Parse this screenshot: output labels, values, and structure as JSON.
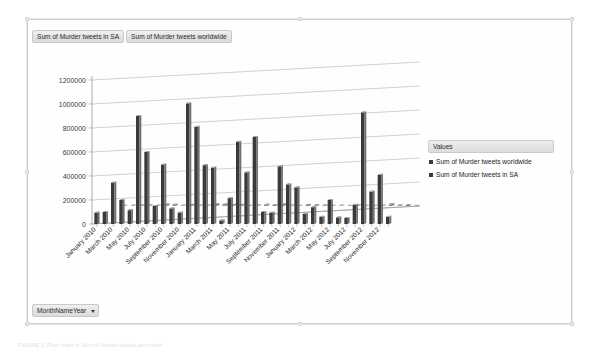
{
  "window": {
    "background": "#ffffff",
    "frame_border": "#cfcfcf"
  },
  "field_buttons": {
    "top": [
      {
        "label": "Sum of Murder tweets in SA"
      },
      {
        "label": "Sum of Murder tweets worldwide"
      }
    ],
    "bottom": {
      "label": "MonthNameYear",
      "caret": "chevron-down-icon"
    }
  },
  "legend": {
    "title": "Values",
    "position": "right",
    "items": [
      {
        "label": "Sum of Murder tweets worldwide",
        "color": "#3a3a3a"
      },
      {
        "label": "Sum of Murder tweets in SA",
        "color": "#585858"
      }
    ]
  },
  "caption": "FIGURE 1: Pivot chart of Sum of Murder tweets per month",
  "chart_data": {
    "type": "bar",
    "title": "",
    "xlabel": "MonthNameYear",
    "ylabel": "",
    "ylim": [
      0,
      1200000
    ],
    "yticks": [
      0,
      200000,
      400000,
      600000,
      800000,
      1000000,
      1200000
    ],
    "ytick_labels": [
      "0",
      "200000",
      "400000",
      "600000",
      "800000",
      "1000000",
      "1200000"
    ],
    "grid": true,
    "three_d": true,
    "legend_position": "right",
    "categories": [
      "January 2010",
      "February 2010",
      "March 2010",
      "April 2010",
      "May 2010",
      "June 2010",
      "July 2010",
      "August 2010",
      "September 2010",
      "October 2010",
      "November 2010",
      "December 2010",
      "January 2011",
      "February 2011",
      "March 2011",
      "April 2011",
      "May 2011",
      "June 2011",
      "July 2011",
      "August 2011",
      "September 2011",
      "October 2011",
      "November 2011",
      "December 2011",
      "January 2012",
      "February 2012",
      "March 2012",
      "April 2012",
      "May 2012",
      "June 2012",
      "July 2012",
      "August 2012",
      "September 2012",
      "October 2012",
      "November 2012",
      "December 2012"
    ],
    "tick_labels_shown": [
      "January 2010",
      "March 2010",
      "May 2010",
      "July 2010",
      "September 2010",
      "November 2010",
      "January 2011",
      "March 2011",
      "May 2011",
      "July 2011",
      "September 2011",
      "November 2011",
      "January 2012",
      "March 2012",
      "May 2012",
      "July 2012",
      "September 2012",
      "November 2012"
    ],
    "series": [
      {
        "name": "Sum of Murder tweets worldwide",
        "color": "#3a3a3a",
        "values": [
          95000,
          100000,
          345000,
          200000,
          115000,
          900000,
          600000,
          150000,
          495000,
          130000,
          95000,
          1005000,
          810000,
          490000,
          470000,
          30000,
          215000,
          685000,
          430000,
          725000,
          100000,
          95000,
          480000,
          330000,
          305000,
          85000,
          140000,
          60000,
          200000,
          55000,
          50000,
          160000,
          930000,
          270000,
          410000,
          60000
        ]
      },
      {
        "name": "Sum of Murder tweets in SA",
        "color": "#8a8a8a",
        "values": [
          2000,
          2500,
          6000,
          4500,
          3000,
          14000,
          11000,
          3500,
          9000,
          3000,
          2500,
          16000,
          13000,
          9500,
          9000,
          900,
          5000,
          12000,
          8000,
          13500,
          2500,
          2200,
          9000,
          6500,
          6000,
          2000,
          3200,
          1500,
          4500,
          1400,
          1300,
          3800,
          15000,
          6000,
          8500,
          1500
        ]
      }
    ]
  }
}
